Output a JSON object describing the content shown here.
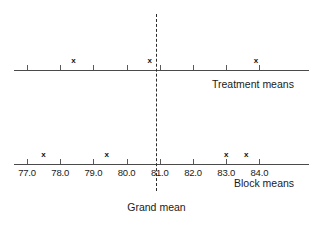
{
  "chart_data": {
    "type": "scatter",
    "title": "",
    "xlabel": "",
    "ylabel": "",
    "xlim": [
      76.6,
      84.4
    ],
    "grid": false,
    "legend_position": "none",
    "axis_tick_labels": [
      "77.0",
      "78.0",
      "79.0",
      "80.0",
      "81.0",
      "82.0",
      "83.0",
      "84.0"
    ],
    "axis_tick_values": [
      77.0,
      78.0,
      79.0,
      80.0,
      81.0,
      82.0,
      83.0,
      84.0
    ],
    "series": [
      {
        "name": "Treatment means",
        "marker": "x",
        "values": [
          78.4,
          80.7,
          83.9
        ]
      },
      {
        "name": "Block means",
        "marker": "x",
        "values": [
          77.5,
          79.4,
          83.0,
          83.6
        ]
      }
    ],
    "annotations": [
      {
        "name": "Grand mean",
        "label": "Grand mean",
        "type": "vertical-dashed-line",
        "value": 80.9
      }
    ]
  },
  "labels": {
    "treatment_means": "Treatment means",
    "block_means": "Block means",
    "grand_mean": "Grand mean"
  },
  "colors": {
    "axis": "#4a4a4a",
    "text": "#1a1a1a",
    "marker": "#111111",
    "grand_mean_line": "#2b2b2b",
    "background": "#ffffff"
  }
}
